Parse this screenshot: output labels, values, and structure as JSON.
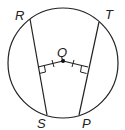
{
  "diagram": {
    "type": "geometry-circle-chords",
    "labels": {
      "R": "R",
      "T": "T",
      "Q": "Q",
      "S": "S",
      "P": "P"
    },
    "circle": {
      "cx": 63,
      "cy": 63,
      "r": 55
    },
    "center": {
      "name": "Q",
      "x": 63,
      "y": 61
    },
    "chords": [
      {
        "name": "RS",
        "from": "R",
        "to": "S"
      },
      {
        "name": "TP",
        "from": "T",
        "to": "P"
      }
    ],
    "perpendiculars": [
      {
        "from": "Q",
        "to_chord": "RS",
        "right_angle": true,
        "tick_marks": 1
      },
      {
        "from": "Q",
        "to_chord": "TP",
        "right_angle": true,
        "tick_marks": 1
      }
    ],
    "stroke_color": "#222222"
  }
}
